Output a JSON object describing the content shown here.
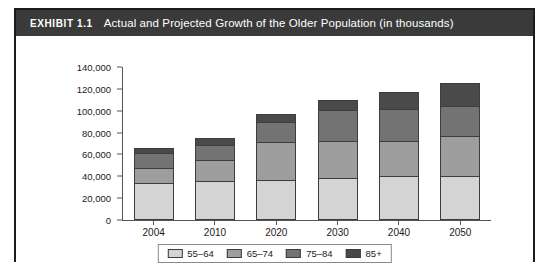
{
  "exhibit": {
    "label": "EXHIBIT 1.1",
    "title": "Actual and Projected Growth of the Older Population (in thousands)"
  },
  "colors": {
    "title_bar_bg": "#3a3a3a",
    "title_text": "#ffffff",
    "frame_border": "#1c1c1c",
    "axis": "#555555",
    "series_55_64": "#d4d4d4",
    "series_65_74": "#9e9e9e",
    "series_75_84": "#737373",
    "series_85_plus": "#4a4a4a"
  },
  "chart_data": {
    "type": "bar",
    "stacked": true,
    "title": "Actual and Projected Growth of the Older Population (in thousands)",
    "xlabel": "",
    "ylabel": "",
    "ylim": [
      0,
      140000
    ],
    "ytick_values": [
      140000,
      120000,
      100000,
      80000,
      60000,
      40000,
      20000,
      0
    ],
    "ytick_labels": [
      "140,000",
      "120,000",
      "100,000",
      "80,000",
      "60,000",
      "40,000",
      "20,000",
      "0"
    ],
    "grid": false,
    "legend_position": "bottom",
    "categories": [
      "2004",
      "2010",
      "2020",
      "2030",
      "2040",
      "2050"
    ],
    "series": [
      {
        "name": "55–64",
        "color": "#d4d4d4",
        "values": [
          34000,
          36000,
          37000,
          38000,
          40000,
          40000
        ]
      },
      {
        "name": "65–74",
        "color": "#9e9e9e",
        "values": [
          14000,
          19000,
          34000,
          34000,
          32000,
          37000
        ]
      },
      {
        "name": "75–84",
        "color": "#737373",
        "values": [
          13000,
          14000,
          19000,
          29000,
          30000,
          27000
        ]
      },
      {
        "name": "85+",
        "color": "#4a4a4a",
        "values": [
          5000,
          6000,
          7000,
          9000,
          15000,
          21000
        ]
      }
    ],
    "totals": [
      66000,
      75000,
      97000,
      110000,
      117000,
      125000
    ]
  }
}
